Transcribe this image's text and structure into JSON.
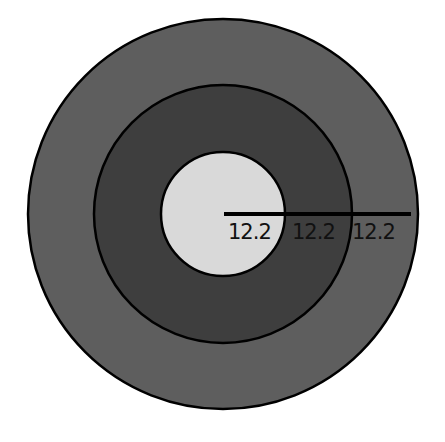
{
  "diagram": {
    "type": "concentric-circles",
    "center": {
      "x": 223,
      "y": 214
    },
    "circles": [
      {
        "name": "outer",
        "radius": 195,
        "fill": "#5e5e5e"
      },
      {
        "name": "middle",
        "radius": 129,
        "fill": "#3e3e3e"
      },
      {
        "name": "inner",
        "radius": 62,
        "fill": "#d9d9d9"
      }
    ],
    "stroke": "#000000",
    "radius_line": {
      "from_x": 224,
      "to_x": 411,
      "y": 214
    },
    "labels": [
      {
        "text": "12.2",
        "x": 228
      },
      {
        "text": "12.2",
        "x": 292
      },
      {
        "text": "12.2",
        "x": 352
      }
    ]
  }
}
